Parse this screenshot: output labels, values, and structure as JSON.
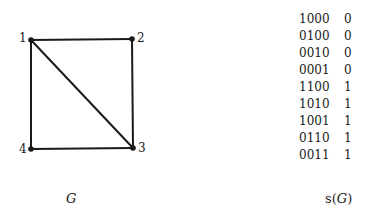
{
  "graph": {
    "nodes": [
      {
        "id": "1",
        "x": 31,
        "y": 40
      },
      {
        "id": "2",
        "x": 132,
        "y": 39
      },
      {
        "id": "3",
        "x": 133,
        "y": 148
      },
      {
        "id": "4",
        "x": 31,
        "y": 149
      }
    ],
    "edges": [
      [
        "1",
        "2"
      ],
      [
        "2",
        "3"
      ],
      [
        "3",
        "4"
      ],
      [
        "4",
        "1"
      ],
      [
        "1",
        "3"
      ]
    ],
    "caption": "G"
  },
  "table": {
    "rows": [
      {
        "code": "1000",
        "value": "0"
      },
      {
        "code": "0100",
        "value": "0"
      },
      {
        "code": "0010",
        "value": "0"
      },
      {
        "code": "0001",
        "value": "0"
      },
      {
        "code": "1100",
        "value": "1"
      },
      {
        "code": "1010",
        "value": "1"
      },
      {
        "code": "1001",
        "value": "1"
      },
      {
        "code": "0110",
        "value": "1"
      },
      {
        "code": "0011",
        "value": "1"
      }
    ],
    "caption_prefix": "s(",
    "caption_var": "G",
    "caption_suffix": ")"
  }
}
